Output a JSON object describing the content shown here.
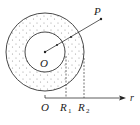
{
  "diagram": {
    "type": "concentric-shell",
    "colors": {
      "stroke": "#333333",
      "dots": "#9a9a9a",
      "background": "#ffffff"
    },
    "center": {
      "label": "O"
    },
    "point": {
      "label": "P"
    },
    "axis": {
      "origin_label": "O",
      "r1_label": "R",
      "r1_sub": "1",
      "r2_label": "R",
      "r2_sub": "2",
      "axis_label": "r"
    }
  }
}
